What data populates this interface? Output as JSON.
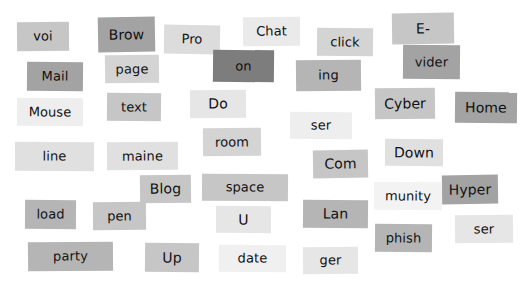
{
  "scene": {
    "kind": "magnetic-poetry-word-tiles",
    "background_color": "#ffffff",
    "width": 524,
    "height": 284,
    "text_color": "#111111",
    "palette": {
      "lightest": "#f3f3f3",
      "lighter": "#eaeaea",
      "light": "#e0e0e0",
      "medium_light": "#d4d4d4",
      "medium": "#c6c6c6",
      "medium_dark": "#b5b5b5",
      "dark": "#a3a3a3",
      "darkest": "#8e8e8e",
      "very_dark": "#7d7d7d"
    }
  },
  "tiles": [
    {
      "label": "voi",
      "x": 17,
      "y": 22,
      "w": 52,
      "h": 29,
      "bg": "#c6c6c6",
      "rotate": -0.6,
      "size": 13
    },
    {
      "label": "Brow",
      "x": 98,
      "y": 17,
      "w": 57,
      "h": 35,
      "bg": "#a3a3a3",
      "rotate": -1.0,
      "size": 14
    },
    {
      "label": "Pro",
      "x": 164,
      "y": 25,
      "w": 56,
      "h": 29,
      "bg": "#dcdcdc",
      "rotate": 0.8,
      "size": 13
    },
    {
      "label": "Chat",
      "x": 243,
      "y": 17,
      "w": 57,
      "h": 29,
      "bg": "#eaeaea",
      "rotate": -0.5,
      "size": 13
    },
    {
      "label": "click",
      "x": 317,
      "y": 28,
      "w": 56,
      "h": 28,
      "bg": "#d4d4d4",
      "rotate": 0.7,
      "size": 13
    },
    {
      "label": "E-",
      "x": 392,
      "y": 13,
      "w": 62,
      "h": 31,
      "bg": "#c6c6c6",
      "rotate": -0.8,
      "size": 14
    },
    {
      "label": "Mail",
      "x": 27,
      "y": 62,
      "w": 56,
      "h": 29,
      "bg": "#a3a3a3",
      "rotate": 0.5,
      "size": 13
    },
    {
      "label": "page",
      "x": 105,
      "y": 55,
      "w": 54,
      "h": 28,
      "bg": "#d4d4d4",
      "rotate": -0.7,
      "size": 13
    },
    {
      "label": "on",
      "x": 213,
      "y": 50,
      "w": 61,
      "h": 32,
      "bg": "#7d7d7d",
      "rotate": 0.6,
      "size": 13
    },
    {
      "label": "ing",
      "x": 296,
      "y": 60,
      "w": 65,
      "h": 31,
      "bg": "#b5b5b5",
      "rotate": -0.6,
      "size": 13
    },
    {
      "label": "vider",
      "x": 403,
      "y": 45,
      "w": 57,
      "h": 34,
      "bg": "#a3a3a3",
      "rotate": 0.4,
      "size": 13
    },
    {
      "label": "Mouse",
      "x": 17,
      "y": 98,
      "w": 66,
      "h": 28,
      "bg": "#eeeeee",
      "rotate": 0.4,
      "size": 13
    },
    {
      "label": "text",
      "x": 107,
      "y": 93,
      "w": 54,
      "h": 28,
      "bg": "#c6c6c6",
      "rotate": 0.5,
      "size": 13
    },
    {
      "label": "Do",
      "x": 190,
      "y": 90,
      "w": 56,
      "h": 28,
      "bg": "#e6e6e6",
      "rotate": -0.5,
      "size": 14
    },
    {
      "label": "Cyber",
      "x": 375,
      "y": 88,
      "w": 60,
      "h": 31,
      "bg": "#c6c6c6",
      "rotate": -0.6,
      "size": 14
    },
    {
      "label": "Home",
      "x": 455,
      "y": 92,
      "w": 62,
      "h": 31,
      "bg": "#a3a3a3",
      "rotate": 0.5,
      "size": 14
    },
    {
      "label": "ser",
      "x": 290,
      "y": 112,
      "w": 62,
      "h": 27,
      "bg": "#eeeeee",
      "rotate": 0.4,
      "size": 13
    },
    {
      "label": "room",
      "x": 203,
      "y": 128,
      "w": 58,
      "h": 28,
      "bg": "#d4d4d4",
      "rotate": -0.6,
      "size": 13
    },
    {
      "label": "line",
      "x": 15,
      "y": 142,
      "w": 79,
      "h": 29,
      "bg": "#e0e0e0",
      "rotate": 0.3,
      "size": 13
    },
    {
      "label": "maine",
      "x": 107,
      "y": 142,
      "w": 71,
      "h": 28,
      "bg": "#e0e0e0",
      "rotate": -0.4,
      "size": 13
    },
    {
      "label": "Com",
      "x": 313,
      "y": 150,
      "w": 55,
      "h": 28,
      "bg": "#c6c6c6",
      "rotate": -0.8,
      "size": 14
    },
    {
      "label": "Down",
      "x": 385,
      "y": 139,
      "w": 58,
      "h": 27,
      "bg": "#e0e0e0",
      "rotate": 0.4,
      "size": 14
    },
    {
      "label": "Blog",
      "x": 140,
      "y": 175,
      "w": 51,
      "h": 28,
      "bg": "#c6c6c6",
      "rotate": -0.7,
      "size": 14
    },
    {
      "label": "space",
      "x": 202,
      "y": 174,
      "w": 86,
      "h": 27,
      "bg": "#c6c6c6",
      "rotate": 0.4,
      "size": 13
    },
    {
      "label": "Hyper",
      "x": 442,
      "y": 175,
      "w": 56,
      "h": 29,
      "bg": "#a3a3a3",
      "rotate": -0.8,
      "size": 14
    },
    {
      "label": "munity",
      "x": 374,
      "y": 182,
      "w": 68,
      "h": 28,
      "bg": "#f3f3f3",
      "rotate": 0.4,
      "size": 13
    },
    {
      "label": "load",
      "x": 25,
      "y": 200,
      "w": 51,
      "h": 29,
      "bg": "#b5b5b5",
      "rotate": 0.4,
      "size": 13
    },
    {
      "label": "pen",
      "x": 93,
      "y": 202,
      "w": 53,
      "h": 28,
      "bg": "#c6c6c6",
      "rotate": -0.5,
      "size": 13
    },
    {
      "label": "U",
      "x": 216,
      "y": 206,
      "w": 55,
      "h": 27,
      "bg": "#e6e6e6",
      "rotate": 0.3,
      "size": 14
    },
    {
      "label": "Lan",
      "x": 303,
      "y": 200,
      "w": 65,
      "h": 28,
      "bg": "#b5b5b5",
      "rotate": 0.5,
      "size": 14
    },
    {
      "label": "ser",
      "x": 455,
      "y": 215,
      "w": 58,
      "h": 28,
      "bg": "#e6e6e6",
      "rotate": -0.5,
      "size": 13
    },
    {
      "label": "phish",
      "x": 375,
      "y": 224,
      "w": 57,
      "h": 28,
      "bg": "#b5b5b5",
      "rotate": 0.5,
      "size": 13
    },
    {
      "label": "party",
      "x": 28,
      "y": 242,
      "w": 85,
      "h": 29,
      "bg": "#b5b5b5",
      "rotate": -0.5,
      "size": 13
    },
    {
      "label": "Up",
      "x": 145,
      "y": 243,
      "w": 54,
      "h": 29,
      "bg": "#c6c6c6",
      "rotate": 0.5,
      "size": 14
    },
    {
      "label": "date",
      "x": 219,
      "y": 245,
      "w": 67,
      "h": 27,
      "bg": "#f0f0f0",
      "rotate": 0.3,
      "size": 13
    },
    {
      "label": "ger",
      "x": 303,
      "y": 247,
      "w": 55,
      "h": 27,
      "bg": "#e6e6e6",
      "rotate": -0.4,
      "size": 13
    }
  ]
}
